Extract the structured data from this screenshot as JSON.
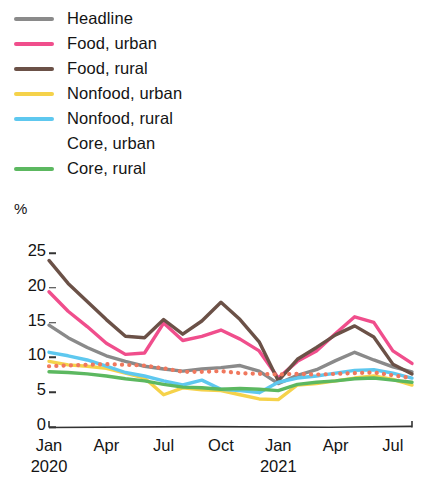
{
  "legend": {
    "position": "top-left",
    "items": [
      {
        "label": "Headline",
        "color": "#8a8a8a",
        "style": "solid"
      },
      {
        "label": "Food, urban",
        "color": "#f04e8c",
        "style": "solid"
      },
      {
        "label": "Food, rural",
        "color": "#6b5147",
        "style": "solid"
      },
      {
        "label": "Nonfood, urban",
        "color": "#f5d24a",
        "style": "solid"
      },
      {
        "label": "Nonfood, rural",
        "color": "#5ec8ef",
        "style": "solid"
      },
      {
        "label": "Core, urban",
        "color": "#f0785e",
        "style": "dotted"
      },
      {
        "label": "Core, rural",
        "color": "#5cb860",
        "style": "solid"
      }
    ]
  },
  "axes": {
    "ylabel": "%",
    "yticks": [
      "0",
      "5",
      "10",
      "15",
      "20",
      "25"
    ],
    "xticks": [
      {
        "label": "Jan",
        "year": "2020"
      },
      {
        "label": "Apr",
        "year": ""
      },
      {
        "label": "Jul",
        "year": ""
      },
      {
        "label": "Oct",
        "year": ""
      },
      {
        "label": "Jan",
        "year": "2021"
      },
      {
        "label": "Apr",
        "year": ""
      },
      {
        "label": "Jul",
        "year": ""
      }
    ]
  },
  "chart_data": {
    "type": "line",
    "title": "",
    "xlabel": "",
    "ylabel": "%",
    "ylim": [
      0,
      26.5
    ],
    "grid": false,
    "legend_position": "top-left",
    "x": [
      "2020-01",
      "2020-02",
      "2020-03",
      "2020-04",
      "2020-05",
      "2020-06",
      "2020-07",
      "2020-08",
      "2020-09",
      "2020-10",
      "2020-11",
      "2020-12",
      "2021-01",
      "2021-02",
      "2021-03",
      "2021-04",
      "2021-05",
      "2021-06",
      "2021-07",
      "2021-08"
    ],
    "xtick_labels": [
      "Jan 2020",
      "Apr",
      "Jul",
      "Oct",
      "Jan 2021",
      "Apr",
      "Jul"
    ],
    "series": [
      {
        "name": "Headline",
        "color": "#8a8a8a",
        "style": "solid",
        "values": [
          14.2,
          12.4,
          11.0,
          9.8,
          9.0,
          8.3,
          7.9,
          7.6,
          7.9,
          8.1,
          8.4,
          7.6,
          5.8,
          7.0,
          7.8,
          9.1,
          10.3,
          9.2,
          8.2,
          7.5
        ]
      },
      {
        "name": "Food, urban",
        "color": "#f04e8c",
        "style": "solid",
        "values": [
          19.0,
          16.2,
          14.0,
          11.6,
          10.0,
          10.2,
          14.5,
          12.0,
          12.6,
          13.5,
          12.2,
          10.5,
          6.6,
          9.0,
          10.5,
          13.0,
          15.4,
          14.6,
          10.5,
          8.7
        ]
      },
      {
        "name": "Food, rural",
        "color": "#6b5147",
        "style": "solid",
        "values": [
          23.5,
          20.2,
          17.6,
          15.0,
          12.6,
          12.4,
          15.0,
          12.9,
          14.8,
          17.5,
          15.0,
          11.8,
          6.2,
          9.3,
          11.0,
          12.8,
          14.1,
          12.5,
          8.6,
          7.2
        ]
      },
      {
        "name": "Nonfood, urban",
        "color": "#f5d24a",
        "style": "solid",
        "values": [
          9.0,
          8.5,
          8.3,
          8.0,
          7.3,
          6.6,
          4.2,
          5.2,
          4.9,
          4.8,
          4.2,
          3.6,
          3.5,
          5.6,
          5.8,
          6.2,
          6.6,
          6.9,
          6.4,
          5.6
        ]
      },
      {
        "name": "Nonfood, rural",
        "color": "#5ec8ef",
        "style": "solid",
        "values": [
          10.3,
          9.8,
          9.2,
          8.3,
          7.4,
          6.9,
          6.2,
          5.6,
          6.3,
          5.0,
          4.8,
          4.5,
          6.0,
          6.6,
          6.9,
          7.3,
          7.7,
          7.8,
          7.3,
          6.6
        ]
      },
      {
        "name": "Core, urban",
        "color": "#f0785e",
        "style": "dotted",
        "values": [
          8.3,
          8.4,
          8.5,
          8.6,
          8.5,
          8.4,
          8.0,
          7.5,
          7.5,
          7.6,
          7.3,
          7.2,
          7.1,
          7.2,
          7.1,
          7.2,
          7.3,
          7.4,
          7.0,
          6.6
        ]
      },
      {
        "name": "Core, rural",
        "color": "#5cb860",
        "style": "solid",
        "values": [
          7.5,
          7.4,
          7.2,
          6.9,
          6.5,
          6.2,
          5.7,
          5.3,
          5.2,
          5.0,
          5.1,
          5.0,
          4.8,
          5.7,
          6.0,
          6.2,
          6.5,
          6.6,
          6.3,
          6.0
        ]
      }
    ]
  }
}
